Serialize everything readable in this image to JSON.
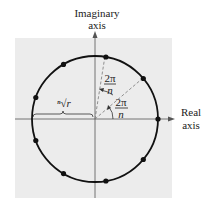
{
  "figure": {
    "axis_labels": {
      "imaginary_line1": "Imaginary",
      "imaginary_line2": "axis",
      "real_line1": "Real",
      "real_line2": "axis"
    },
    "radius_label": "ⁿ√r",
    "angle_labels": [
      {
        "numerator": "2π",
        "denominator": "n"
      },
      {
        "numerator": "2π",
        "denominator": "n"
      }
    ],
    "points_count": 9,
    "point_angles_deg": [
      0,
      40,
      80,
      120,
      160,
      200,
      240,
      280,
      320
    ],
    "colors": {
      "background_panel": "#ececec",
      "circle": "#111111",
      "axes": "#555555",
      "dashes": "#777777"
    }
  }
}
